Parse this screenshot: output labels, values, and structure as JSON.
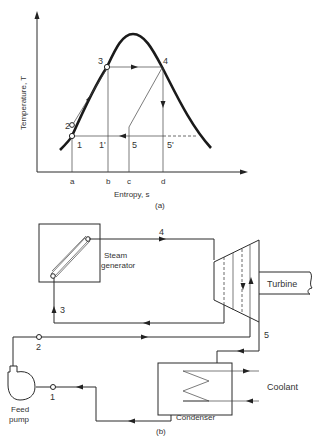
{
  "figure_a": {
    "caption": "(a)",
    "y_axis_label": "Temperature, T",
    "x_axis_label": "Entropy, s",
    "x_ticks": [
      "a",
      "b",
      "c",
      "d"
    ],
    "state_points": [
      "1",
      "2",
      "3",
      "4",
      "1'",
      "5",
      "5'"
    ]
  },
  "figure_b": {
    "caption": "(b)",
    "components": {
      "steam_generator": "Steam\ngenerator",
      "steam_generator_line1": "Steam",
      "steam_generator_line2": "generator",
      "turbine": "Turbine",
      "condenser": "Condenser",
      "coolant": "Coolant",
      "feed_pump_line1": "Feed",
      "feed_pump_line2": "pump"
    },
    "state_points": [
      "1",
      "2",
      "3",
      "4",
      "5"
    ]
  }
}
